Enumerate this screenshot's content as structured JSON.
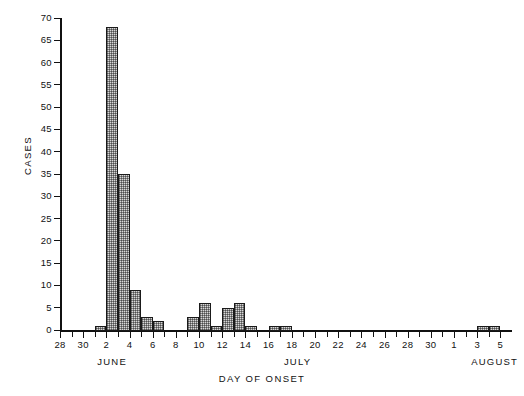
{
  "chart_data": {
    "type": "bar",
    "title": "",
    "xlabel": "DAY OF ONSET",
    "ylabel": "CASES",
    "ylim": [
      0,
      70
    ],
    "ytick_step": 5,
    "yticks": [
      0,
      5,
      10,
      15,
      20,
      25,
      30,
      35,
      40,
      45,
      50,
      55,
      60,
      65,
      70
    ],
    "grid": false,
    "legend": null,
    "xtick_step_days": 1,
    "xlabel_step_days": 2,
    "x_axis_start": "June 28",
    "x_axis_end": "August 5",
    "month_groups": [
      {
        "label": "JUNE",
        "center_day_index": 4
      },
      {
        "label": "JULY",
        "center_day_index": 20
      },
      {
        "label": "AUGUST",
        "center_day_index": 37
      }
    ],
    "categories": [
      "June 28",
      "June 29",
      "June 30",
      "July 1",
      "July 2",
      "July 3",
      "July 4",
      "July 5",
      "July 6",
      "July 7",
      "July 8",
      "July 9",
      "July 10",
      "July 11",
      "July 12",
      "July 13",
      "July 14",
      "July 15",
      "July 16",
      "July 17",
      "July 18",
      "July 19",
      "July 20",
      "July 21",
      "July 22",
      "July 23",
      "July 24",
      "July 25",
      "July 26",
      "July 27",
      "July 28",
      "July 29",
      "July 30",
      "July 31",
      "August 1",
      "August 2",
      "August 3",
      "August 4",
      "August 5"
    ],
    "tick_labels": [
      "28",
      "",
      "30",
      "",
      "2",
      "",
      "4",
      "",
      "6",
      "",
      "8",
      "",
      "10",
      "",
      "12",
      "",
      "14",
      "",
      "16",
      "",
      "18",
      "",
      "20",
      "",
      "22",
      "",
      "24",
      "",
      "26",
      "",
      "28",
      "",
      "30",
      "",
      "1",
      "",
      "3",
      "",
      "5"
    ],
    "values": [
      0,
      0,
      0,
      1,
      68,
      35,
      9,
      3,
      2,
      0,
      0,
      3,
      6,
      1,
      5,
      6,
      1,
      0,
      1,
      1,
      0,
      0,
      0,
      0,
      0,
      0,
      0,
      0,
      0,
      0,
      0,
      0,
      0,
      0,
      0,
      0,
      1,
      1,
      0
    ],
    "bar_fill_color": "#d8d8d8",
    "bar_edge_color": "#1a1a1a",
    "axis_color": "#111111",
    "background_color": "#ffffff"
  }
}
